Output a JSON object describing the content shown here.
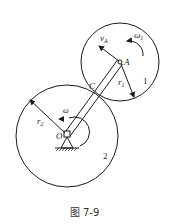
{
  "figure": {
    "caption": "图 7-9"
  },
  "labels": {
    "vA": "v",
    "vA_sub": "A",
    "omega1": "ω",
    "omega1_sub": "1",
    "A": "A",
    "r1": "r",
    "r1_sub": "1",
    "gear1": "1",
    "C": "C",
    "r2": "r",
    "r2_sub": "2",
    "omega": "ω",
    "O": "O",
    "gear2": "2"
  },
  "colors": {
    "stroke": "#1a1a1a",
    "background": "#ffffff"
  }
}
